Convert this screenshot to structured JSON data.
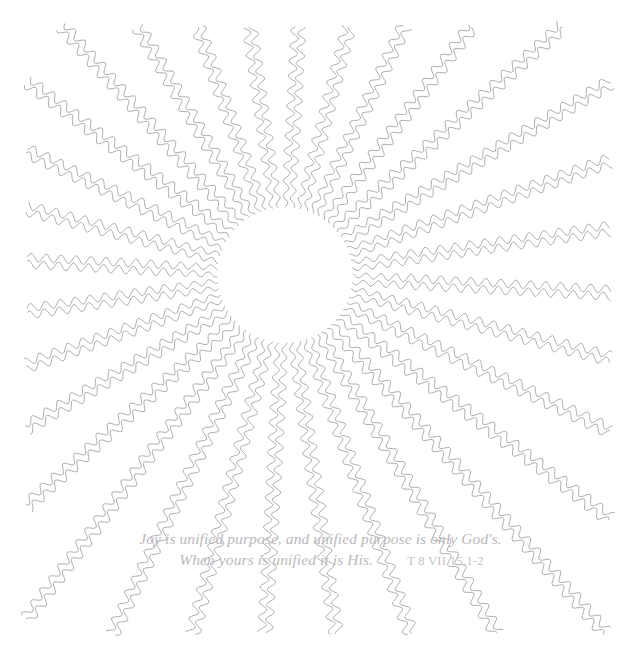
{
  "artwork": {
    "title": "Radiant Sunburst Quote Card",
    "background_color": "#ffffff",
    "canvas": {
      "width": 637,
      "height": 660
    },
    "center": {
      "x": 285,
      "y": 275
    },
    "inner_radius": 68,
    "ray_count": 32,
    "strands_per_ray": 2,
    "line_color": "#9a9a9f",
    "line_width": 0.8,
    "wave_amplitude": 4.2,
    "wave_period": 15
  },
  "quote": {
    "line1": "Joy is unified purpose, and unified purpose is only God's.",
    "line2": "When yours is unified it is His.",
    "citation": "T 8 VII 15.1-2",
    "text_color": "#b9b9bd",
    "citation_color": "#c2c2c6"
  }
}
